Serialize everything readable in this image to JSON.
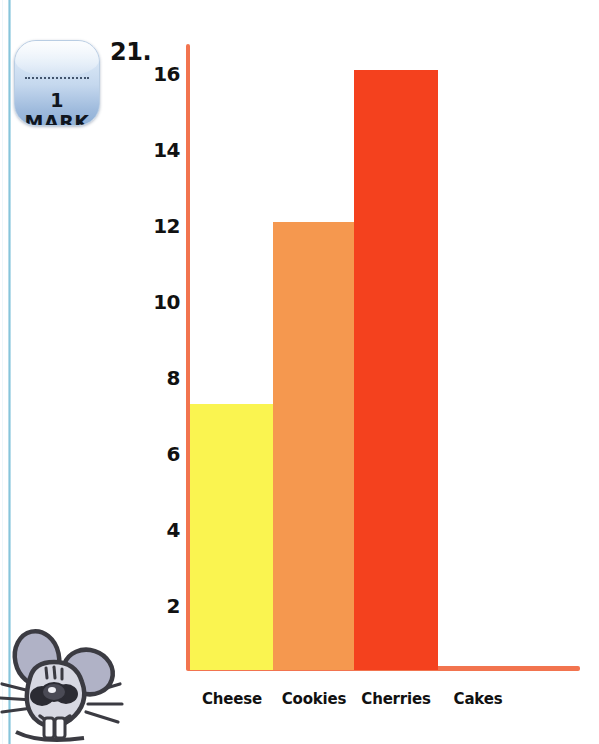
{
  "page": {
    "question_number": "21.",
    "mark_badge_label": "1 MARK"
  },
  "chart_data": {
    "type": "bar",
    "title": "",
    "subtitle": "",
    "xlabel": "",
    "ylabel": "",
    "categories": [
      "Cheese",
      "Cookies",
      "Cherries",
      "Cakes"
    ],
    "values": [
      7,
      11.8,
      15.8,
      0
    ],
    "series": [
      {
        "name": "Favourite food",
        "values": [
          7,
          11.8,
          15.8,
          0
        ]
      }
    ],
    "bar_colors": [
      "#faf450",
      "#f5984f",
      "#f4411e",
      "#f4411e"
    ],
    "ylim": [
      0,
      16.6
    ],
    "yticks": [
      2,
      4,
      6,
      8,
      10,
      12,
      14,
      16
    ],
    "ytick_labels": [
      "2",
      "4",
      "6",
      "8",
      "10",
      "12",
      "14",
      "16"
    ],
    "grid": false,
    "legend": "none",
    "axis_color": "#f2744f"
  },
  "colors": {
    "axis": "#f2744f",
    "bar_yellow": "#faf450",
    "bar_orange": "#f5984f",
    "bar_red": "#f4411e",
    "text": "#111111",
    "rule_blue": "#86c5da",
    "badge_blue": "#9fbbdd",
    "mouse_grey": "#9a9cb4"
  },
  "icons": {
    "mark_badge": "mark-badge-icon",
    "mascot": "mouse-mascot-icon"
  }
}
